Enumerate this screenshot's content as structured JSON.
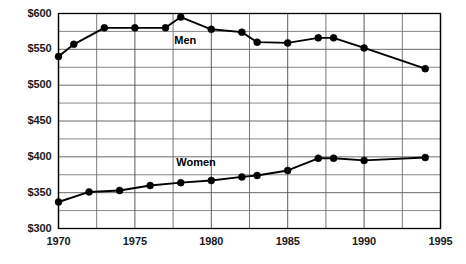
{
  "chart_data": {
    "type": "line",
    "title": "",
    "subtitle": "",
    "xlabel": "",
    "ylabel": "",
    "xlim": [
      1970,
      1995
    ],
    "ylim": [
      300,
      600
    ],
    "grid": true,
    "x_major_ticks": [
      1970,
      1975,
      1980,
      1985,
      1990,
      1995
    ],
    "x_minor_step": 2.5,
    "y_major_ticks": [
      300,
      350,
      400,
      450,
      500,
      550,
      600
    ],
    "y_minor_step": 25,
    "x_tick_labels": [
      "1970",
      "1975",
      "1980",
      "1985",
      "1990",
      "1995"
    ],
    "y_tick_labels": [
      "$300",
      "$350",
      "$400",
      "$450",
      "$500",
      "$550",
      "$600"
    ],
    "legend_position": "inline-annotation",
    "series": [
      {
        "name": "Men",
        "label": "Men",
        "color": "#000000",
        "marker": "circle",
        "label_x": 1978.3,
        "label_y": 562,
        "x": [
          1970,
          1971,
          1973,
          1975,
          1977,
          1978,
          1980,
          1982,
          1983,
          1985,
          1987,
          1988,
          1990,
          1994
        ],
        "values": [
          540,
          557,
          580,
          580,
          580,
          595,
          578,
          574,
          560,
          559,
          566,
          566,
          552,
          523
        ]
      },
      {
        "name": "Women",
        "label": "Women",
        "color": "#000000",
        "marker": "circle",
        "label_x": 1979.0,
        "label_y": 392,
        "x": [
          1970,
          1972,
          1974,
          1976,
          1978,
          1980,
          1982,
          1983,
          1985,
          1987,
          1988,
          1990,
          1994
        ],
        "values": [
          337,
          351,
          353,
          360,
          364,
          367,
          372,
          374,
          381,
          398,
          398,
          395,
          399
        ]
      }
    ]
  },
  "axis": {
    "y_labels": [
      "$600",
      "$550",
      "$500",
      "$450",
      "$400",
      "$350",
      "$300"
    ],
    "x_labels": [
      "1970",
      "1975",
      "1980",
      "1985",
      "1990",
      "1995"
    ]
  }
}
